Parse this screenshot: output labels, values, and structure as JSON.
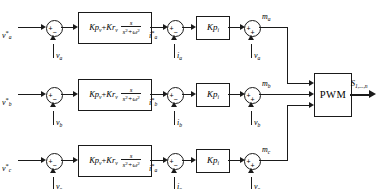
{
  "diagram": {
    "phases": [
      {
        "id": "a",
        "ref_label": "v*a",
        "ref_sym": "v",
        "ref_sub": "a",
        "ref_star": "*",
        "v_fb_sym": "v",
        "v_fb_sub": "a",
        "pr_lead": "Kp",
        "pr_lead_sub": "v",
        "pr_res": "Kr",
        "pr_res_sub": "v",
        "pr_num": "s",
        "pr_den": "s",
        "pr_den_exp": "2",
        "pr_den_tail": "+ω",
        "pr_den_tail_exp": "2",
        "i_ref_sym": "i",
        "i_ref_sub": "a",
        "i_ref_star": "*",
        "i_fb_sym": "i",
        "i_fb_sub": "a",
        "kpi_lead": "Kp",
        "kpi_sub": "i",
        "ff_sym": "v",
        "ff_sub": "a",
        "out_sym": "m",
        "out_sub": "a",
        "sum1_left_sign": "+",
        "sum1_bot_sign": "−",
        "sum2_left_sign": "+",
        "sum2_bot_sign": "−",
        "sum3_left_sign": "+",
        "sum3_bot_sign": "+"
      },
      {
        "id": "b",
        "ref_sym": "v",
        "ref_sub": "b",
        "ref_star": "*",
        "v_fb_sym": "v",
        "v_fb_sub": "b",
        "pr_lead": "Kp",
        "pr_lead_sub": "v",
        "pr_res": "Kr",
        "pr_res_sub": "v",
        "pr_num": "s",
        "pr_den": "s",
        "pr_den_exp": "2",
        "pr_den_tail": "+ω",
        "pr_den_tail_exp": "2",
        "i_ref_sym": "i",
        "i_ref_sub": "b",
        "i_ref_star": "*",
        "i_fb_sym": "i",
        "i_fb_sub": "b",
        "kpi_lead": "Kp",
        "kpi_sub": "i",
        "ff_sym": "v",
        "ff_sub": "b",
        "out_sym": "m",
        "out_sub": "b",
        "sum1_left_sign": "+",
        "sum1_bot_sign": "−",
        "sum2_left_sign": "+",
        "sum2_bot_sign": "−",
        "sum3_left_sign": "+",
        "sum3_bot_sign": "+"
      },
      {
        "id": "c",
        "ref_sym": "v",
        "ref_sub": "c",
        "ref_star": "*",
        "v_fb_sym": "v",
        "v_fb_sub": "c",
        "pr_lead": "Kp",
        "pr_lead_sub": "v",
        "pr_res": "Kr",
        "pr_res_sub": "v",
        "pr_num": "s",
        "pr_den": "s",
        "pr_den_exp": "2",
        "pr_den_tail": "+ω",
        "pr_den_tail_exp": "2",
        "i_ref_sym": "i",
        "i_ref_sub": "a",
        "i_ref_star": "*",
        "i_fb_sym": "i",
        "i_fb_sub": "c",
        "kpi_lead": "Kp",
        "kpi_sub": "i",
        "ff_sym": "v",
        "ff_sub": "c",
        "out_sym": "m",
        "out_sub": "c",
        "sum1_left_sign": "+",
        "sum1_bot_sign": "−",
        "sum2_left_sign": "+",
        "sum2_bot_sign": "−",
        "sum3_left_sign": "+",
        "sum3_bot_sign": "+"
      }
    ],
    "pwm": {
      "label": "PWM"
    },
    "output": {
      "sym": "S",
      "sub": "1,...,n"
    }
  }
}
